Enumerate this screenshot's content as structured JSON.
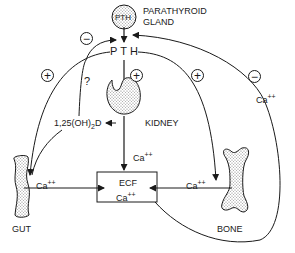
{
  "diagram": {
    "nodes": {
      "parathyroid": {
        "inner_label": "PTH",
        "label_line1": "PARATHYROID",
        "label_line2": "GLAND"
      },
      "pth": {
        "label": "PTH"
      },
      "kidney": {
        "label": "KIDNEY"
      },
      "vitamin_d": {
        "label_prefix": "1,25(OH)",
        "label_sub": "2",
        "label_suffix": "D"
      },
      "ecf": {
        "label_line1": "ECF",
        "label_line2_base": "Ca",
        "label_line2_sup": "++"
      },
      "gut": {
        "label": "GUT"
      },
      "bone": {
        "label": "BONE"
      }
    },
    "edge_labels": {
      "kidney_to_ecf": {
        "base": "Ca",
        "sup": "++"
      },
      "gut_to_ecf": {
        "base": "Ca",
        "sup": "++"
      },
      "bone_to_ecf": {
        "base": "Ca",
        "sup": "++"
      },
      "ecf_feedback": {
        "base": "Ca",
        "sup": "++"
      }
    },
    "signs": {
      "vitd_to_parathyroid": "−",
      "pth_to_gut": "+",
      "pth_to_kidney": "+",
      "pth_to_bone": "+",
      "ca_feedback": "−"
    },
    "question_mark": "?",
    "colors": {
      "stroke": "#1a1a1a",
      "stipple": "#c8c8c8",
      "background": "#ffffff"
    }
  }
}
